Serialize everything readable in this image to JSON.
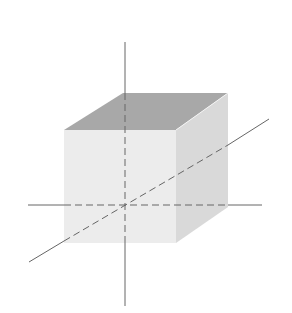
{
  "diagram": {
    "type": "3d-coordinate-axes-with-cube",
    "labels": {
      "x": "x",
      "y": "y",
      "z": "z"
    },
    "colors": {
      "top_face": "#a8a8a8",
      "front_face": "#ececec",
      "right_face": "#d9d9d9",
      "axis": "#666666",
      "label": "#333333"
    }
  }
}
